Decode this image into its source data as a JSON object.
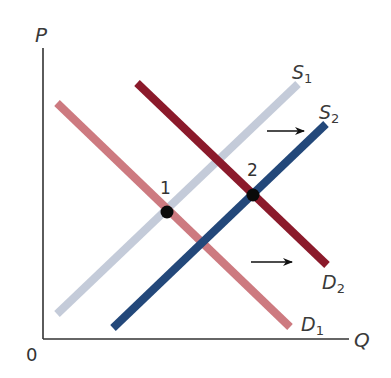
{
  "diagram": {
    "title": "",
    "axes": {
      "y_label": "P",
      "x_label": "Q",
      "origin_label": "0"
    },
    "curves": [
      {
        "id": "S1",
        "label_base": "S",
        "label_sub": "1",
        "type": "supply",
        "color": "#c4cbd9",
        "from": [
          57,
          314
        ],
        "to": [
          298,
          84
        ]
      },
      {
        "id": "S2",
        "label_base": "S",
        "label_sub": "2",
        "type": "supply",
        "color": "#23487a",
        "from": [
          113,
          328
        ],
        "to": [
          326,
          124
        ]
      },
      {
        "id": "D1",
        "label_base": "D",
        "label_sub": "1",
        "type": "demand",
        "color": "#cd7a80",
        "from": [
          57,
          103
        ],
        "to": [
          290,
          327
        ]
      },
      {
        "id": "D2",
        "label_base": "D",
        "label_sub": "2",
        "type": "demand",
        "color": "#8b1a2b",
        "from": [
          137,
          83
        ],
        "to": [
          327,
          265
        ]
      }
    ],
    "equilibria": [
      {
        "label": "1",
        "x": 167,
        "y": 212
      },
      {
        "label": "2",
        "x": 253,
        "y": 195
      }
    ],
    "shift_arrows": [
      {
        "name": "supply-shift-arrow",
        "from": [
          267,
          131
        ],
        "to": [
          304,
          131
        ]
      },
      {
        "name": "demand-shift-arrow",
        "from": [
          251,
          262
        ],
        "to": [
          292,
          262
        ]
      }
    ]
  }
}
